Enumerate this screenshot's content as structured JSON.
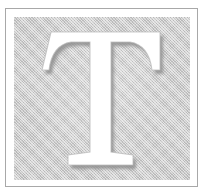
{
  "figure": {
    "kind": "scanned-decorative-initial",
    "caption": "Decorative drop cap initial",
    "letter": "T",
    "letter_style": "serif-capital-reversed-white"
  },
  "frame": {
    "name": "ruled-border",
    "rule_color": "#a8a8a8",
    "rule_width_px": 1,
    "margin_color": "#ffffff",
    "left_px": 5,
    "top_px": 8,
    "width_px": 193,
    "height_px": 179
  },
  "panel": {
    "name": "halftone-field",
    "fill_color": "#c9c9c9",
    "texture": "diagonal-crosshatch-halftone",
    "highlight_color": "#ffffff",
    "shade_color": "#969696",
    "left_px": 14,
    "top_px": 17,
    "width_px": 176,
    "height_px": 163
  },
  "glyph": {
    "name": "letter-T",
    "character": "T",
    "fill_color": "#ffffff",
    "shadow_color": "#9a9a9a",
    "edge_color": "#b5b5b5",
    "arm_top_y_px": 15,
    "arm_left_x_px": 37,
    "arm_right_x_px": 146,
    "foot_baseline_y_px": 148,
    "stem_width_px": 22
  },
  "background": {
    "page_color": "#ffffff"
  }
}
